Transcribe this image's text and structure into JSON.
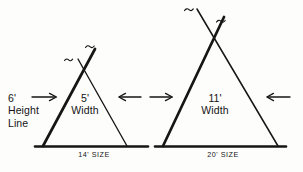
{
  "figure": {
    "ink_color": "#161616",
    "background_color": "#fdfdfc",
    "tents": [
      {
        "name": "small-teepee",
        "width_label": "5'",
        "width_unit_label": "Width",
        "size_label": "14' SIZE",
        "height_label": "6'",
        "height_line_label_1": "Height",
        "height_line_label_2": "Line"
      },
      {
        "name": "large-teepee",
        "width_label": "11'",
        "width_unit_label": "Width",
        "size_label": "20' SIZE"
      }
    ],
    "arrows": [
      {
        "name": "height-line-arrow",
        "direction": "right"
      },
      {
        "name": "small-tent-right-arrow",
        "direction": "left"
      },
      {
        "name": "large-tent-left-arrow",
        "direction": "right"
      },
      {
        "name": "large-tent-right-arrow",
        "direction": "left"
      }
    ]
  }
}
